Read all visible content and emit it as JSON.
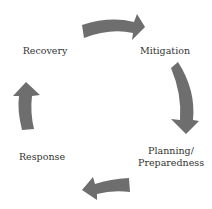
{
  "diagram": {
    "type": "cycle",
    "nodes": [
      {
        "id": "mitigation",
        "label": "Mitigation"
      },
      {
        "id": "planning",
        "label_line1": "Planning/",
        "label_line2": "Preparedness"
      },
      {
        "id": "response",
        "label": "Response"
      },
      {
        "id": "recovery",
        "label": "Recovery"
      }
    ],
    "edges": [
      {
        "from": "recovery",
        "to": "mitigation"
      },
      {
        "from": "mitigation",
        "to": "planning"
      },
      {
        "from": "planning",
        "to": "response"
      },
      {
        "from": "response",
        "to": "recovery"
      }
    ],
    "arrow_color": "#6e6e6e",
    "text_color": "#333333"
  }
}
